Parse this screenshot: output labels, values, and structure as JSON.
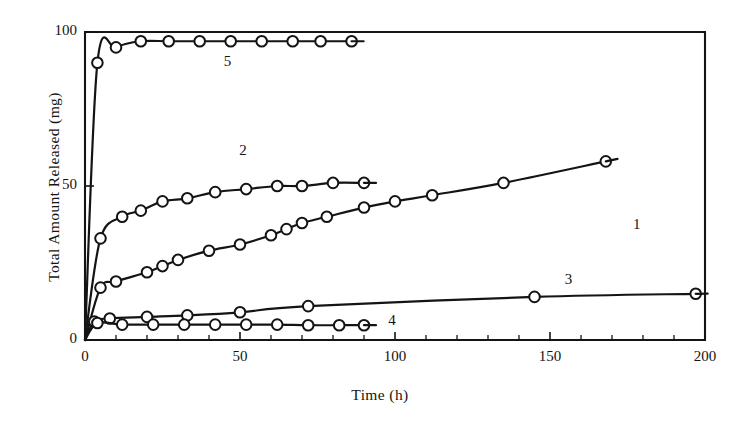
{
  "chart_data": {
    "type": "line",
    "title": "",
    "xlabel": "Time (h)",
    "ylabel": "Total Amount Released (mg)",
    "xlim": [
      0,
      200
    ],
    "ylim": [
      0,
      100
    ],
    "xticks": [
      0,
      50,
      100,
      150,
      200
    ],
    "yticks": [
      0,
      50,
      100
    ],
    "xtick_labels": [
      "0",
      "50",
      "100",
      "150",
      "200"
    ],
    "ytick_labels": [
      "0",
      "50",
      "100"
    ],
    "x_minor_tick_step": 10,
    "grid": false,
    "legend_position": "inline-curve-labels",
    "marker": "open-circle",
    "line_color": "#141414",
    "series": [
      {
        "name": "1",
        "label": "1",
        "label_x": 178,
        "label_y": 37,
        "points": [
          [
            0,
            0
          ],
          [
            5,
            17
          ],
          [
            10,
            19
          ],
          [
            20,
            22
          ],
          [
            25,
            24
          ],
          [
            30,
            26
          ],
          [
            40,
            29
          ],
          [
            50,
            31
          ],
          [
            60,
            34
          ],
          [
            65,
            36
          ],
          [
            70,
            38
          ],
          [
            78,
            40
          ],
          [
            90,
            43
          ],
          [
            100,
            45
          ],
          [
            112,
            47
          ],
          [
            135,
            51
          ],
          [
            168,
            58
          ]
        ]
      },
      {
        "name": "2",
        "label": "2",
        "label_x": 51,
        "label_y": 61,
        "points": [
          [
            0,
            0
          ],
          [
            5,
            33
          ],
          [
            12,
            40
          ],
          [
            18,
            42
          ],
          [
            25,
            45
          ],
          [
            33,
            46
          ],
          [
            42,
            48
          ],
          [
            52,
            49
          ],
          [
            62,
            50
          ],
          [
            70,
            50
          ],
          [
            80,
            51
          ],
          [
            90,
            51
          ]
        ]
      },
      {
        "name": "3",
        "label": "3",
        "label_x": 156,
        "label_y": 19,
        "points": [
          [
            0,
            0
          ],
          [
            3,
            6
          ],
          [
            8,
            7
          ],
          [
            20,
            7.5
          ],
          [
            33,
            8
          ],
          [
            50,
            9
          ],
          [
            72,
            11
          ],
          [
            145,
            14
          ],
          [
            197,
            15
          ]
        ]
      },
      {
        "name": "4",
        "label": "4",
        "label_x": 99,
        "label_y": 6,
        "points": [
          [
            0,
            0
          ],
          [
            4,
            5.5
          ],
          [
            12,
            5
          ],
          [
            22,
            5
          ],
          [
            32,
            5
          ],
          [
            42,
            5
          ],
          [
            52,
            5
          ],
          [
            62,
            5
          ],
          [
            72,
            4.8
          ],
          [
            82,
            4.8
          ],
          [
            90,
            4.8
          ]
        ]
      },
      {
        "name": "5",
        "label": "5",
        "label_x": 46,
        "label_y": 90,
        "points": [
          [
            0,
            0
          ],
          [
            4,
            90
          ],
          [
            10,
            95
          ],
          [
            18,
            97
          ],
          [
            27,
            97
          ],
          [
            37,
            97
          ],
          [
            47,
            97
          ],
          [
            57,
            97
          ],
          [
            67,
            97
          ],
          [
            76,
            97
          ],
          [
            86,
            97
          ]
        ]
      }
    ]
  }
}
